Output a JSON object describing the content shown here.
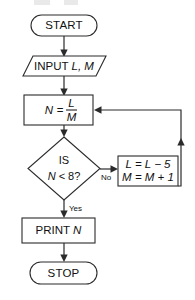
{
  "diagram": {
    "type": "flowchart",
    "colors": {
      "stroke": "#2b2b2b",
      "text": "#111111",
      "background": "#ffffff"
    },
    "nodes": {
      "start": {
        "id": "start",
        "shape": "terminator",
        "label": "START"
      },
      "input": {
        "id": "input",
        "shape": "parallelogram",
        "label": "INPUT L, M",
        "keyword": "INPUT",
        "variables": "L, M"
      },
      "compute": {
        "id": "compute",
        "shape": "rectangle",
        "label": "N = L / M",
        "lhs": "N",
        "equals": "=",
        "numerator": "L",
        "denominator": "M"
      },
      "decision": {
        "id": "decision",
        "shape": "diamond",
        "line1": "IS",
        "line2_var": "N",
        "line2_rest": "< 8?",
        "label": "IS N < 8?"
      },
      "update": {
        "id": "update",
        "shape": "rectangle",
        "line1": "L = L − 5",
        "line2": "M = M + 1"
      },
      "print": {
        "id": "print",
        "shape": "rectangle",
        "label": "PRINT N",
        "keyword": "PRINT",
        "variable": "N"
      },
      "stop": {
        "id": "stop",
        "shape": "terminator",
        "label": "STOP"
      }
    },
    "branch_labels": {
      "no": "No",
      "yes": "Yes"
    },
    "edges": [
      {
        "from": "start",
        "to": "input",
        "label": ""
      },
      {
        "from": "input",
        "to": "compute",
        "label": ""
      },
      {
        "from": "compute",
        "to": "decision",
        "label": ""
      },
      {
        "from": "decision",
        "to": "update",
        "label": "No"
      },
      {
        "from": "decision",
        "to": "print",
        "label": "Yes"
      },
      {
        "from": "update",
        "to": "compute",
        "label": ""
      },
      {
        "from": "print",
        "to": "stop",
        "label": ""
      }
    ]
  }
}
